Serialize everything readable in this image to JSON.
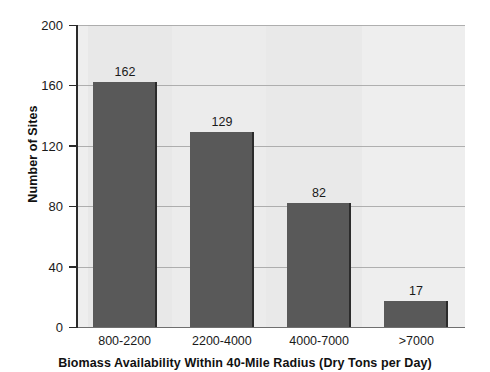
{
  "chart_data": {
    "type": "bar",
    "title": "",
    "xlabel": "Biomass Availability Within 40-Mile Radius (Dry Tons per Day)",
    "ylabel": "Number of Sites",
    "categories": [
      "800-2200",
      "2200-4000",
      "4000-7000",
      ">7000"
    ],
    "values": [
      162,
      129,
      82,
      17
    ],
    "value_labels": [
      "162",
      "129",
      "82",
      "17"
    ],
    "ylim": [
      0,
      200
    ],
    "yticks": [
      0,
      40,
      80,
      120,
      160,
      200
    ],
    "ytick_labels": [
      "0",
      "40",
      "80",
      "120",
      "160",
      "200"
    ],
    "grid": "horizontal",
    "legend": "none",
    "series": [
      {
        "name": "Number of Sites",
        "values": [
          162,
          129,
          82,
          17
        ],
        "color": "#595959"
      }
    ],
    "colors": {
      "bar_fill": "#595959",
      "bar_edge": "#2b2b2b",
      "plot_background": "#ebebeb",
      "gridline": "#9a9a9a",
      "axis": "#2a2a2a",
      "text": "#1a1a1a",
      "figure_background": "#ffffff"
    }
  }
}
